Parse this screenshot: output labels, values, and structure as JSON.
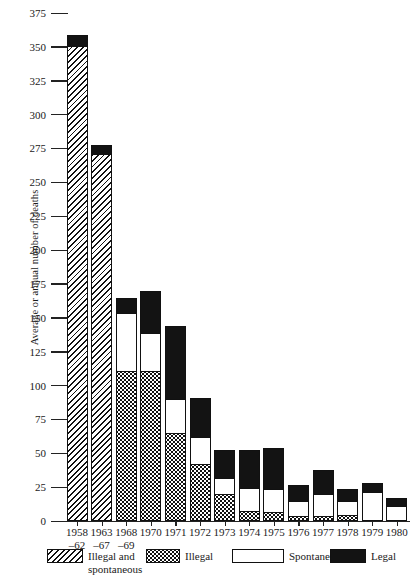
{
  "chart_data": {
    "type": "bar",
    "subtype": "stacked-vertical",
    "title": "",
    "xlabel": "",
    "ylabel": "Average or annual number of deaths",
    "ylim": [
      0,
      375
    ],
    "ytick_step": 25,
    "yticks": [
      375,
      350,
      325,
      300,
      275,
      250,
      225,
      200,
      175,
      150,
      125,
      100,
      75,
      50,
      25,
      0
    ],
    "grid": false,
    "legend_position": "bottom",
    "categories": [
      "1958–62",
      "1963–67",
      "1968–69",
      "1970",
      "1971",
      "1972",
      "1973",
      "1974",
      "1975",
      "1976",
      "1977",
      "1978",
      "1979",
      "1980"
    ],
    "category_lines": [
      {
        "l1": "1958",
        "l2": "–62"
      },
      {
        "l1": "1963",
        "l2": "–67"
      },
      {
        "l1": "1968",
        "l2": "–69"
      },
      {
        "l1": "1970",
        "l2": ""
      },
      {
        "l1": "1971",
        "l2": ""
      },
      {
        "l1": "1972",
        "l2": ""
      },
      {
        "l1": "1973",
        "l2": ""
      },
      {
        "l1": "1974",
        "l2": ""
      },
      {
        "l1": "1975",
        "l2": ""
      },
      {
        "l1": "1976",
        "l2": ""
      },
      {
        "l1": "1977",
        "l2": ""
      },
      {
        "l1": "1978",
        "l2": ""
      },
      {
        "l1": "1979",
        "l2": ""
      },
      {
        "l1": "1980",
        "l2": ""
      }
    ],
    "series": [
      {
        "name": "Illegal and spontaneous",
        "pattern": "diagonal-hatch",
        "color": "#ffffff",
        "values": [
          350,
          270,
          0,
          0,
          0,
          0,
          0,
          0,
          0,
          0,
          0,
          0,
          0,
          0
        ]
      },
      {
        "name": "Illegal",
        "pattern": "dots",
        "color": "#ffffff",
        "values": [
          0,
          0,
          110,
          110,
          64,
          41,
          19,
          7,
          6,
          3,
          3,
          4,
          0,
          0
        ]
      },
      {
        "name": "Spontaneous",
        "pattern": "solid",
        "color": "#ffffff",
        "values": [
          0,
          0,
          43,
          28,
          25,
          20,
          12,
          17,
          17,
          11,
          16,
          10,
          21,
          10
        ]
      },
      {
        "name": "Legal",
        "pattern": "solid",
        "color": "#131313",
        "values": [
          8,
          7,
          11,
          31,
          54,
          29,
          21,
          28,
          30,
          12,
          18,
          9,
          6,
          6
        ]
      }
    ],
    "totals": [
      358,
      277,
      164,
      169,
      143,
      90,
      52,
      52,
      53,
      26,
      37,
      23,
      27,
      16
    ]
  },
  "legend": {
    "items": [
      {
        "label_line1": "Illegal and",
        "label_line2": "spontaneous",
        "pattern": "diagonal-hatch"
      },
      {
        "label_line1": "Illegal",
        "label_line2": "",
        "pattern": "dots"
      },
      {
        "label_line1": "Spontaneous",
        "label_line2": "",
        "pattern": "white"
      },
      {
        "label_line1": "Legal",
        "label_line2": "",
        "pattern": "black"
      }
    ]
  }
}
